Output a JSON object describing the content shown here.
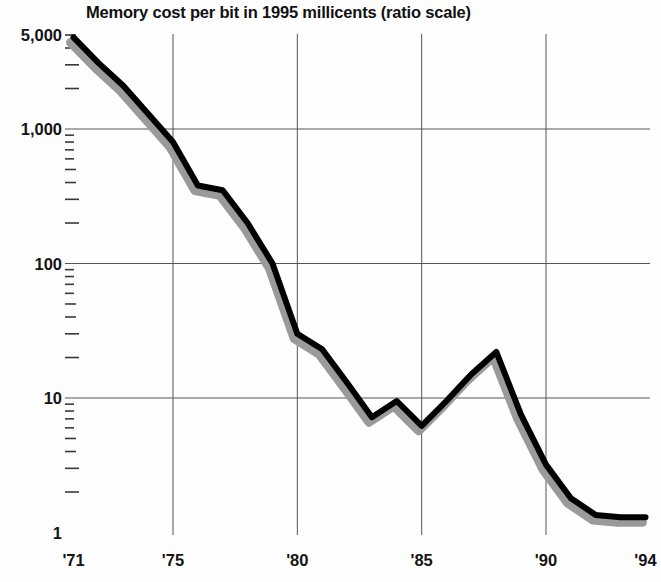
{
  "chart_data": {
    "type": "line",
    "title": "Memory cost per bit in 1995 millicents (ratio scale)",
    "xlabel": "",
    "ylabel": "",
    "scale": "log",
    "grid": true,
    "legend": null,
    "xlim": [
      1971,
      1994
    ],
    "ylim": [
      1,
      5000
    ],
    "y_ticks": [
      {
        "label": "5,000",
        "value": 5000
      },
      {
        "label": "1,000",
        "value": 1000
      },
      {
        "label": "100",
        "value": 100
      },
      {
        "label": "10",
        "value": 10
      },
      {
        "label": "1",
        "value": 1
      }
    ],
    "x_ticks": [
      {
        "label": "'71",
        "value": 1971,
        "gridline": false
      },
      {
        "label": "'75",
        "value": 1975,
        "gridline": true
      },
      {
        "label": "'80",
        "value": 1980,
        "gridline": true
      },
      {
        "label": "'85",
        "value": 1985,
        "gridline": true
      },
      {
        "label": "'90",
        "value": 1990,
        "gridline": true
      },
      {
        "label": "'94",
        "value": 1994,
        "gridline": false
      }
    ],
    "series": [
      {
        "name": "Memory cost per bit",
        "color": "#000000",
        "shadow_color": "#9a9a9a",
        "x": [
          1971,
          1972,
          1973,
          1974,
          1975,
          1976,
          1977,
          1978,
          1979,
          1980,
          1981,
          1982,
          1983,
          1984,
          1985,
          1986,
          1987,
          1988,
          1989,
          1990,
          1991,
          1992,
          1993,
          1994
        ],
        "values": [
          4800,
          3100,
          2100,
          1300,
          800,
          380,
          350,
          200,
          100,
          30,
          23,
          13,
          7.2,
          9.5,
          6.2,
          9.5,
          15,
          22,
          7.5,
          3.2,
          1.8,
          1.35,
          1.3,
          1.3
        ]
      }
    ]
  },
  "axis_style": {
    "minor_ticks_per_decade": 8,
    "gridline_color": "#555555"
  }
}
